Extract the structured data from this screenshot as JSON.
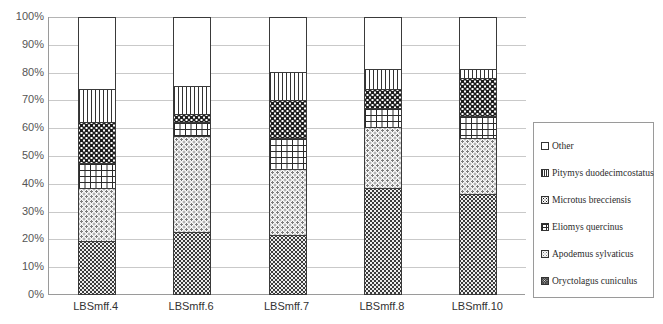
{
  "chart_data": {
    "type": "bar",
    "stacked": true,
    "stack_mode": "percent",
    "title": "",
    "xlabel": "",
    "ylabel": "",
    "ylim": [
      0,
      100
    ],
    "ytick_labels": [
      "100%",
      "90%",
      "80%",
      "70%",
      "60%",
      "50%",
      "40%",
      "30%",
      "20%",
      "10%",
      "0%"
    ],
    "ytick_values": [
      100,
      90,
      80,
      70,
      60,
      50,
      40,
      30,
      20,
      10,
      0
    ],
    "grid": true,
    "legend_position": "right",
    "categories": [
      "LBSmff.4",
      "LBSmff.6",
      "LBSmff.7",
      "LBSmff.8",
      "LBSmff.10"
    ],
    "series": [
      {
        "name": "Oryctolagus cuniculus",
        "pattern": "dark-checker",
        "values": [
          19,
          22,
          21,
          38,
          36
        ]
      },
      {
        "name": "Apodemus sylvaticus",
        "pattern": "light-dots",
        "values": [
          19,
          35,
          24,
          22,
          20
        ]
      },
      {
        "name": "Eliomys quercinus",
        "pattern": "brick",
        "values": [
          9,
          5,
          11,
          7,
          8
        ]
      },
      {
        "name": "Microtus brecciensis",
        "pattern": "dense-speckle",
        "values": [
          15,
          3,
          14,
          7,
          14
        ]
      },
      {
        "name": "Pitymys duodecimcostatus",
        "pattern": "vertical-stripes",
        "values": [
          12,
          10,
          10,
          7,
          3
        ]
      },
      {
        "name": "Other",
        "pattern": "solid-white",
        "values": [
          26,
          25,
          20,
          19,
          19
        ]
      }
    ],
    "cumulative_tops": {
      "LBSmff.4": [
        19,
        38,
        47,
        62,
        74,
        100
      ],
      "LBSmff.6": [
        22,
        57,
        62,
        65,
        75,
        100
      ],
      "LBSmff.7": [
        21,
        45,
        56,
        70,
        80,
        100
      ],
      "LBSmff.8": [
        38,
        60,
        67,
        74,
        81,
        100
      ],
      "LBSmff.10": [
        36,
        56,
        64,
        78,
        81,
        100
      ]
    }
  },
  "legend": {
    "items": [
      {
        "label": "Other",
        "swatch": "solid-white"
      },
      {
        "label": "Pitymys duodecimcostatus",
        "swatch": "vertical-stripes"
      },
      {
        "label": "Microtus brecciensis",
        "swatch": "dense-speckle"
      },
      {
        "label": "Eliomys quercinus",
        "swatch": "brick"
      },
      {
        "label": "Apodemus sylvaticus",
        "swatch": "light-dots"
      },
      {
        "label": "Oryctolagus cuniculus",
        "swatch": "dark-checker"
      }
    ]
  }
}
